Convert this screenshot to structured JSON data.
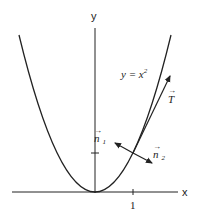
{
  "diagram": {
    "axes": {
      "x_label": "x",
      "y_label": "y",
      "x_tick": "1"
    },
    "curve": {
      "label_lhs": "y = x",
      "label_exp": "2"
    },
    "vectors": {
      "tangent": "T",
      "normal1": "n",
      "normal1_sub": "1",
      "normal2": "n",
      "normal2_sub": "2"
    },
    "colors": {
      "stroke": "#222222",
      "background": "#ffffff"
    }
  }
}
